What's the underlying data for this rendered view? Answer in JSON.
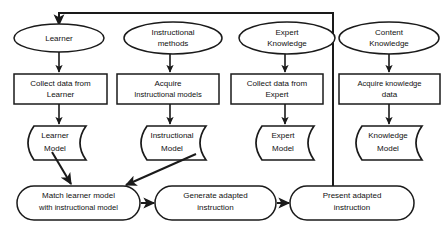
{
  "diagram": {
    "colors": {
      "stroke": "#1a1a1a",
      "fill": "#ffffff",
      "text": "#111111"
    },
    "sources": [
      {
        "id": "learner",
        "label": "Learner"
      },
      {
        "id": "instr-methods",
        "label_line1": "Instructional",
        "label_line2": "methods"
      },
      {
        "id": "expert",
        "label_line1": "Expert",
        "label_line2": "Knowledge"
      },
      {
        "id": "content",
        "label_line1": "Content",
        "label_line2": "Knowledge"
      }
    ],
    "processes": [
      {
        "id": "collect-learner",
        "label_line1": "Collect data from",
        "label_line2": "Learner"
      },
      {
        "id": "acquire-instr",
        "label_line1": "Acquire",
        "label_line2": "Instructional models"
      },
      {
        "id": "collect-expert",
        "label_line1": "Collect data from",
        "label_line2": "Expert"
      },
      {
        "id": "acquire-knowledge",
        "label_line1": "Acquire knowledge",
        "label_line2": "data"
      }
    ],
    "models": [
      {
        "id": "learner-model",
        "label_line1": "Learner",
        "label_line2": "Model"
      },
      {
        "id": "instructional-model",
        "label_line1": "Instructional",
        "label_line2": "Model"
      },
      {
        "id": "expert-model",
        "label_line1": "Expert",
        "label_line2": "Model"
      },
      {
        "id": "knowledge-model",
        "label_line1": "Knowledge",
        "label_line2": "Model"
      }
    ],
    "pipeline": [
      {
        "id": "match",
        "label_line1": "Match learner model",
        "label_line2": "with instructional model"
      },
      {
        "id": "generate",
        "label_line1": "Generate adapted",
        "label_line2": "instruction"
      },
      {
        "id": "present",
        "label_line1": "Present adapted",
        "label_line2": "instruction"
      }
    ],
    "feedback_loop": {
      "id": "feedback-loop",
      "from": "present",
      "to": "learner"
    }
  }
}
